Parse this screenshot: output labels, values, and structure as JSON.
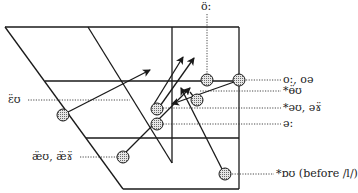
{
  "diagram": {
    "type": "vowel-chart-trapezoid",
    "colors": {
      "line": "#1a1a1a",
      "circle_fill": "#bdbdbd",
      "dotted": "#333333",
      "background": "#ffffff"
    },
    "labels": {
      "top": "ö:",
      "right_1": "o:, oə",
      "right_2": "*ɵ̈ʊ",
      "right_3": "*əʊ, əɤ̈",
      "right_4": "ə:",
      "right_5": "*ɒʊ (before /l/)",
      "left_1": "ɛ̈ʊ",
      "left_2": "æ̈ʊ, æ̈ɤ̈"
    },
    "nodes": [
      {
        "id": "o-long-front",
        "label_ref": "top",
        "x": 207,
        "y": 80
      },
      {
        "id": "o-long",
        "label_ref": "right_1",
        "x": 239,
        "y": 80
      },
      {
        "id": "oo-rounded",
        "label_ref": "right_2",
        "x": 196,
        "y": 100
      },
      {
        "id": "schwa-u",
        "label_ref": "right_3",
        "x": 157,
        "y": 109
      },
      {
        "id": "schwa-long",
        "label_ref": "right_4",
        "x": 157,
        "y": 124
      },
      {
        "id": "e-u",
        "label_ref": "left_1",
        "x": 63,
        "y": 115
      },
      {
        "id": "ae-u",
        "label_ref": "left_2",
        "x": 123,
        "y": 157
      },
      {
        "id": "o-before-l",
        "label_ref": "right_5",
        "x": 225,
        "y": 174
      }
    ],
    "arrows": [
      {
        "from": "e-u",
        "to": [
          150,
          70
        ]
      },
      {
        "from": "schwa-u",
        "to": [
          183,
          57
        ]
      },
      {
        "from": "schwa-u",
        "to": [
          194,
          58
        ]
      },
      {
        "from": "ae-u",
        "to": [
          190,
          88
        ]
      },
      {
        "from": "o-before-l",
        "to": [
          181,
          88
        ]
      },
      {
        "from": "o-long",
        "to": [
          172,
          104
        ]
      }
    ]
  }
}
